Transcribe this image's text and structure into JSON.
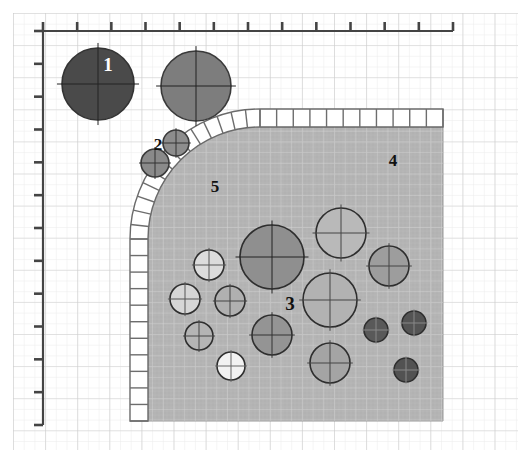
{
  "figure": {
    "name": "schematic-cross-section",
    "background": "#ffffff",
    "grid": {
      "minor_color": "#e8e8e8",
      "major_color": "#cfcfcf",
      "minor_step": 10.7,
      "major_step": 32,
      "origin_x": 13,
      "origin_y": 13
    },
    "axes": {
      "color": "#444444",
      "x_axis": {
        "y": 31,
        "x_start": 43,
        "x_end": 453,
        "tick_count": 13,
        "tick_len": 9,
        "tick_dir": "up"
      },
      "y_axis": {
        "x": 43,
        "y_start": 31,
        "y_end": 425,
        "tick_count": 13,
        "tick_len": 9,
        "tick_dir": "left"
      }
    },
    "region": {
      "name": "hatched-medium-region",
      "fill": "#b4b4b4",
      "stroke": "#8a8a8a",
      "left": 148,
      "right": 443,
      "top": 127,
      "bottom": 421,
      "corner_radius": 112
    },
    "band": {
      "name": "ladder-boundary-band",
      "fill": "#ffffff",
      "stroke": "#6a6a6a",
      "thickness": 18,
      "rung_count_arc": 14,
      "rung_count_top": 11,
      "rung_count_left": 11
    },
    "labels": [
      {
        "id": "1",
        "text": "1",
        "x": 108,
        "y": 71,
        "color": "#ffffff",
        "size": 19,
        "target": "dark-particle-upper-left"
      },
      {
        "id": "2",
        "text": "2",
        "x": 158,
        "y": 150,
        "color": "#111111",
        "size": 17,
        "target": "small-particles-outside-region"
      },
      {
        "id": "3",
        "text": "3",
        "x": 290,
        "y": 310,
        "color": "#111111",
        "size": 19,
        "target": "particles-inside-region"
      },
      {
        "id": "4",
        "text": "4",
        "x": 393,
        "y": 166,
        "color": "#111111",
        "size": 17,
        "target": "region-matrix"
      },
      {
        "id": "5",
        "text": "5",
        "x": 215,
        "y": 192,
        "color": "#111111",
        "size": 17,
        "target": "boundary-band"
      }
    ],
    "particles": [
      {
        "cx": 98,
        "cy": 84,
        "r": 36,
        "fill": "#4a4a4a",
        "stroke": "#333333",
        "cross": "#222222",
        "zone": "outside"
      },
      {
        "cx": 196,
        "cy": 86,
        "r": 35,
        "fill": "#7d7d7d",
        "stroke": "#3a3a3a",
        "cross": "#222222",
        "zone": "outside"
      },
      {
        "cx": 176,
        "cy": 143,
        "r": 13,
        "fill": "#8d8d8d",
        "stroke": "#3a3a3a",
        "cross": "#333333",
        "zone": "outside"
      },
      {
        "cx": 155,
        "cy": 163,
        "r": 14,
        "fill": "#8a8a8a",
        "stroke": "#3a3a3a",
        "cross": "#333333",
        "zone": "outside"
      },
      {
        "cx": 272,
        "cy": 257,
        "r": 32,
        "fill": "#8f8f8f",
        "stroke": "#2e2e2e",
        "cross": "#222222",
        "zone": "inside"
      },
      {
        "cx": 341,
        "cy": 233,
        "r": 25,
        "fill": "#b9b9b9",
        "stroke": "#2e2e2e",
        "cross": "#444444",
        "zone": "inside"
      },
      {
        "cx": 389,
        "cy": 266,
        "r": 20,
        "fill": "#9d9d9d",
        "stroke": "#2e2e2e",
        "cross": "#444444",
        "zone": "inside"
      },
      {
        "cx": 330,
        "cy": 300,
        "r": 27,
        "fill": "#b2b2b2",
        "stroke": "#2e2e2e",
        "cross": "#444444",
        "zone": "inside"
      },
      {
        "cx": 209,
        "cy": 265,
        "r": 15,
        "fill": "#dcdcdc",
        "stroke": "#2e2e2e",
        "cross": "#555555",
        "zone": "inside"
      },
      {
        "cx": 185,
        "cy": 299,
        "r": 15,
        "fill": "#d6d6d6",
        "stroke": "#2e2e2e",
        "cross": "#555555",
        "zone": "inside"
      },
      {
        "cx": 230,
        "cy": 301,
        "r": 15,
        "fill": "#b0b0b0",
        "stroke": "#2e2e2e",
        "cross": "#444444",
        "zone": "inside"
      },
      {
        "cx": 199,
        "cy": 336,
        "r": 14,
        "fill": "#b4b4b4",
        "stroke": "#2e2e2e",
        "cross": "#444444",
        "zone": "inside"
      },
      {
        "cx": 231,
        "cy": 366,
        "r": 14,
        "fill": "#f2f2f2",
        "stroke": "#2e2e2e",
        "cross": "#666666",
        "zone": "inside"
      },
      {
        "cx": 272,
        "cy": 335,
        "r": 20,
        "fill": "#949494",
        "stroke": "#2e2e2e",
        "cross": "#333333",
        "zone": "inside"
      },
      {
        "cx": 330,
        "cy": 363,
        "r": 20,
        "fill": "#a4a4a4",
        "stroke": "#2e2e2e",
        "cross": "#444444",
        "zone": "inside"
      },
      {
        "cx": 376,
        "cy": 330,
        "r": 12,
        "fill": "#595959",
        "stroke": "#2e2e2e",
        "cross": "#888888",
        "zone": "inside"
      },
      {
        "cx": 414,
        "cy": 323,
        "r": 12,
        "fill": "#545454",
        "stroke": "#2e2e2e",
        "cross": "#888888",
        "zone": "inside"
      },
      {
        "cx": 406,
        "cy": 370,
        "r": 12,
        "fill": "#525252",
        "stroke": "#2e2e2e",
        "cross": "#888888",
        "zone": "inside"
      }
    ]
  }
}
